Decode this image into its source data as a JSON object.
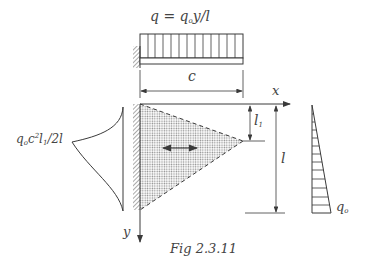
{
  "figure": {
    "caption": "Fig 2.3.11",
    "load_top_label": {
      "q": "q",
      "eq": " = ",
      "q0": "q",
      "q0_sub": "o",
      "rest": "y/l"
    },
    "dim_c": "c",
    "axis_x": "x",
    "axis_y": "y",
    "dim_l1": {
      "main": "l",
      "sub": "1"
    },
    "dim_l": "l",
    "right_load_label": {
      "main": "q",
      "sub": "o"
    },
    "left_moment_label": {
      "q": "q",
      "q_sub": "o",
      "c": "c",
      "c_sup": "2",
      "l": "l",
      "l_sub": "1",
      "rest": "/2l"
    }
  },
  "colors": {
    "line": "#3a3a3a",
    "fill_dots": "#9a9a9a",
    "text": "#444444"
  }
}
